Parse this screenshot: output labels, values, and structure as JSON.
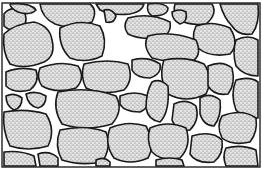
{
  "figure": {
    "colors": {
      "background": "#ffffff",
      "outline": "#1a1a1a",
      "stipple": "#555555",
      "grain_fill": "#d9d9d9"
    },
    "frame": {
      "x": 2,
      "y": 3,
      "width": 258,
      "height": 164
    },
    "grains": [
      "M4,14 Q10,6 22,10 Q30,18 22,30 Q10,32 4,26 Z",
      "M10,4 Q30,2 36,10 Q30,16 18,12 Q10,8 10,4 Z",
      "M40,4 L90,4 Q98,10 92,22 Q70,30 55,24 Q42,18 40,4 Z",
      "M96,4 L144,4 Q142,12 130,14 Q112,16 100,10 Z",
      "M148,4 Q164,2 168,8 Q168,16 152,16 Q146,12 148,4 Z",
      "M175,4 L212,4 Q218,14 206,24 Q190,26 180,20 Q172,12 175,4 Z",
      "M220,4 L258,4 Q260,24 252,34 Q238,36 232,26 Q224,18 220,4 Z",
      "M4,34 Q14,24 34,22 Q50,26 52,40 Q56,56 44,62 Q24,70 10,64 Q2,52 4,34 Z",
      "M60,28 Q80,18 100,26 Q108,40 102,56 Q86,64 70,58 Q58,46 60,28 Z",
      "M104,10 Q112,8 116,16 Q114,24 106,22 Z",
      "M128,18 Q150,12 170,22 Q172,34 160,38 Q140,40 128,34 Q122,26 128,18 Z",
      "M172,12 Q180,8 186,12 Q188,22 180,24 Q172,20 172,12 Z",
      "M196,26 Q212,20 230,28 Q240,44 230,54 Q210,58 198,48 Q190,38 196,26 Z",
      "M236,40 Q248,34 258,40 L258,76 Q244,76 236,66 Q232,52 236,40 Z",
      "M148,36 Q170,30 196,40 Q202,54 194,60 Q172,64 152,58 Q142,46 148,36 Z",
      "M6,72 Q20,66 36,70 Q40,82 30,90 Q14,94 6,86 Z",
      "M40,68 Q60,60 78,66 Q86,78 76,88 Q56,94 42,86 Q36,78 40,68 Z",
      "M84,64 Q108,58 128,64 Q134,80 124,90 Q102,96 86,88 Q80,76 84,64 Z",
      "M132,60 Q148,56 160,64 Q162,74 150,78 Q136,78 132,70 Z",
      "M164,60 Q186,56 204,64 Q214,78 206,94 Q186,104 168,94 Q158,78 164,60 Z",
      "M208,66 Q222,60 232,68 Q236,84 228,94 Q214,96 208,86 Z",
      "M236,80 Q250,76 258,82 L258,118 Q244,120 236,110 Q230,94 236,80 Z",
      "M6,96 Q14,92 22,98 Q22,108 14,110 Q6,106 6,96 Z",
      "M26,94 Q36,90 46,96 Q46,106 38,108 Q28,106 26,94 Z",
      "M58,92 Q90,86 116,96 Q124,110 112,124 Q86,132 62,124 Q52,108 58,92 Z",
      "M120,96 Q134,90 148,96 Q150,108 140,112 Q124,112 120,104 Z",
      "M152,82 Q160,78 168,86 Q170,112 160,122 Q148,120 146,108 Q146,92 152,82 Z",
      "M174,104 Q186,98 196,106 Q200,120 190,130 Q176,132 172,120 Z",
      "M200,98 Q210,92 220,100 Q222,116 214,126 Q204,126 200,114 Z",
      "M222,116 Q242,108 256,118 Q258,132 250,142 Q232,146 222,138 Q216,126 222,116 Z",
      "M4,112 Q26,108 46,114 Q56,130 48,146 Q28,152 10,146 Q2,130 4,112 Z",
      "M60,130 Q86,124 106,132 Q112,148 102,162 Q80,166 62,160 Q54,146 60,130 Z",
      "M110,128 Q128,120 146,126 Q156,144 148,158 Q130,166 114,158 Q104,144 110,128 Z",
      "M150,128 Q168,120 186,128 Q192,146 180,158 Q162,162 152,152 Q146,140 150,128 Z",
      "M192,136 Q212,130 222,140 Q224,154 214,162 Q196,164 190,154 Z",
      "M226,148 Q242,144 256,150 L258,166 L226,166 Q222,156 226,148 Z",
      "M4,152 Q20,150 34,156 L36,166 L4,166 Z",
      "M38,154 Q50,150 58,158 L58,166 L40,166 Z",
      "M96,160 Q104,156 110,162 L110,166 L96,166 Z",
      "M156,160 Q170,156 182,160 L184,166 L156,166 Z"
    ]
  }
}
